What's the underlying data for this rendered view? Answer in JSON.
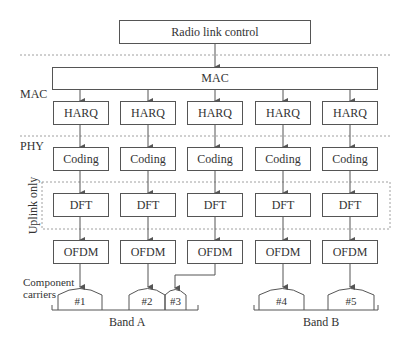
{
  "diagram": {
    "top_box": "Radio link control",
    "mac_box": "MAC",
    "layer_labels": {
      "mac": "MAC",
      "phy": "PHY",
      "uplink": "Uplink only"
    },
    "rows": {
      "harq": [
        "HARQ",
        "HARQ",
        "HARQ",
        "HARQ",
        "HARQ"
      ],
      "coding": [
        "Coding",
        "Coding",
        "Coding",
        "Coding",
        "Coding"
      ],
      "dft": [
        "DFT",
        "DFT",
        "DFT",
        "DFT",
        "DFT"
      ],
      "ofdm": [
        "OFDM",
        "OFDM",
        "OFDM",
        "OFDM",
        "OFDM"
      ]
    },
    "component_carriers_label_line1": "Component",
    "component_carriers_label_line2": "carriers",
    "carriers": [
      "#1",
      "#2",
      "#3",
      "#4",
      "#5"
    ],
    "bands": [
      "Band A",
      "Band B"
    ]
  }
}
